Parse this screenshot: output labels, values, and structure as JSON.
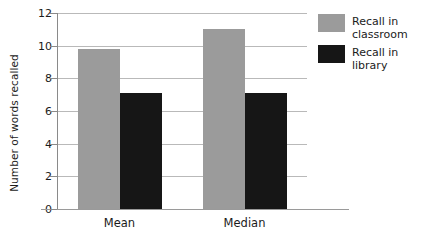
{
  "chart_data": {
    "type": "bar",
    "title": "",
    "xlabel": "",
    "ylabel": "Number of words recalled",
    "categories": [
      "Mean",
      "Median"
    ],
    "series": [
      {
        "name": "Recall in classroom",
        "color": "#9b9b9b",
        "values": [
          9.8,
          11.0
        ]
      },
      {
        "name": "Recall in library",
        "color": "#161616",
        "values": [
          7.1,
          7.1
        ]
      }
    ],
    "ylim": [
      0,
      12
    ],
    "ytick_labels": [
      "12",
      "10",
      "8",
      "6",
      "4",
      "2",
      "0"
    ],
    "ytick_values": [
      12,
      10,
      8,
      6,
      4,
      2,
      0
    ],
    "grid": "horizontal",
    "legend_position": "right"
  },
  "legend": {
    "items": [
      {
        "label": "Recall in\nclassroom"
      },
      {
        "label": "Recall in library"
      }
    ]
  }
}
